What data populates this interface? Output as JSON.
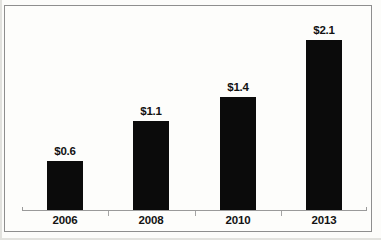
{
  "chart_data": {
    "type": "bar",
    "title": "",
    "subtitle": "",
    "xlabel": "",
    "ylabel": "",
    "categories": [
      "2006",
      "2008",
      "2010",
      "2013"
    ],
    "values": [
      0.6,
      1.1,
      1.4,
      2.1
    ],
    "data_labels": [
      "$0.6",
      "$1.1",
      "$1.4",
      "$2.1"
    ],
    "series": [
      {
        "name": "",
        "values": [
          0.6,
          1.1,
          1.4,
          2.1
        ]
      }
    ],
    "ylim": [
      0,
      2.4
    ],
    "grid": false,
    "legend": false,
    "legend_position": "none",
    "bar_color": "#0b0b0b",
    "axis_color": "#9a9a9a",
    "value_prefix": "$"
  },
  "frame": {
    "border_color": "#8e8e8e",
    "background_color": "#fdfdfb"
  },
  "bars": [
    {
      "label": "$0.6",
      "category": "2006",
      "value": 0.6,
      "height_px": 45
    },
    {
      "label": "$1.1",
      "category": "2008",
      "value": 1.1,
      "height_px": 83
    },
    {
      "label": "$1.4",
      "category": "2010",
      "value": 1.4,
      "height_px": 105
    },
    {
      "label": "$2.1",
      "category": "2013",
      "value": 2.1,
      "height_px": 157
    }
  ]
}
